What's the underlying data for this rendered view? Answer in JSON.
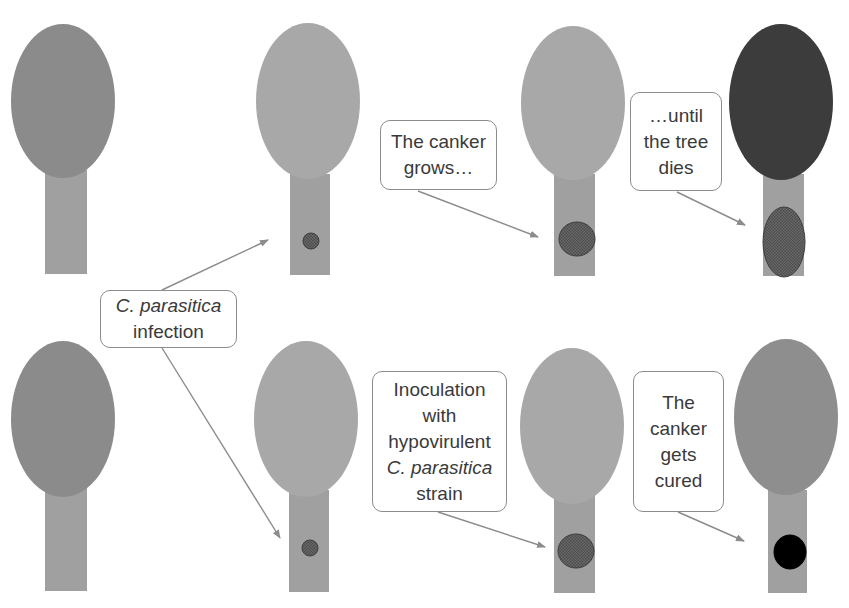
{
  "diagram": {
    "colors": {
      "crown_healthy_dark": "#8b8b8b",
      "crown_healthy_light": "#a6a6a6",
      "crown_dead": "#3c3c3c",
      "trunk": "#a0a0a0",
      "trunk_dark": "#939393",
      "canker": "#5e5e5e",
      "canker_cured": "#000000",
      "arrow": "#8c8c8c",
      "callout_border": "#8c8c8c",
      "text": "#3a3a3a"
    },
    "rows": [
      {
        "name": "untreated",
        "trees": [
          {
            "id": "top-1",
            "state": "healthy",
            "crown": {
              "cx": 63,
              "cy": 101,
              "rx": 52,
              "ry": 77,
              "color": "#8b8b8b"
            },
            "trunk": {
              "x": 45,
              "y": 170,
              "w": 42,
              "h": 104
            },
            "canker": null
          },
          {
            "id": "top-2",
            "state": "infected",
            "crown": {
              "cx": 308,
              "cy": 101,
              "rx": 52,
              "ry": 78,
              "color": "#a8a8a8"
            },
            "trunk": {
              "x": 290,
              "y": 174,
              "w": 40,
              "h": 101
            },
            "canker": {
              "shape": "circle",
              "cx": 311,
              "cy": 241,
              "rx": 8,
              "ry": 8,
              "color": "#5e5e5e"
            }
          },
          {
            "id": "top-3",
            "state": "canker-growing",
            "crown": {
              "cx": 573,
              "cy": 103,
              "rx": 52,
              "ry": 77,
              "color": "#a8a8a8"
            },
            "trunk": {
              "x": 554,
              "y": 174,
              "w": 41,
              "h": 102
            },
            "canker": {
              "shape": "circle",
              "cx": 577,
              "cy": 239,
              "rx": 18,
              "ry": 17,
              "color": "#5e5e5e"
            }
          },
          {
            "id": "top-4",
            "state": "dead",
            "crown": {
              "cx": 781,
              "cy": 102,
              "rx": 52,
              "ry": 78,
              "color": "#3c3c3c"
            },
            "trunk": {
              "x": 763,
              "y": 174,
              "w": 41,
              "h": 102
            },
            "canker": {
              "shape": "ellipse",
              "cx": 784,
              "cy": 242,
              "rx": 21,
              "ry": 35,
              "color": "#5e5e5e"
            }
          }
        ]
      },
      {
        "name": "treated",
        "trees": [
          {
            "id": "bottom-1",
            "state": "healthy",
            "crown": {
              "cx": 63,
              "cy": 419,
              "rx": 52,
              "ry": 78,
              "color": "#8b8b8b"
            },
            "trunk": {
              "x": 45,
              "y": 488,
              "w": 42,
              "h": 103
            },
            "canker": null
          },
          {
            "id": "bottom-2",
            "state": "infected",
            "crown": {
              "cx": 306,
              "cy": 419,
              "rx": 52,
              "ry": 78,
              "color": "#a8a8a8"
            },
            "trunk": {
              "x": 289,
              "y": 490,
              "w": 40,
              "h": 102
            },
            "canker": {
              "shape": "circle",
              "cx": 310,
              "cy": 548,
              "rx": 8,
              "ry": 8,
              "color": "#5e5e5e"
            }
          },
          {
            "id": "bottom-3",
            "state": "inoculated",
            "crown": {
              "cx": 572,
              "cy": 426,
              "rx": 52,
              "ry": 78,
              "color": "#a8a8a8"
            },
            "trunk": {
              "x": 554,
              "y": 494,
              "w": 41,
              "h": 99
            },
            "canker": {
              "shape": "circle",
              "cx": 576,
              "cy": 551,
              "rx": 18,
              "ry": 17,
              "color": "#5e5e5e"
            }
          },
          {
            "id": "bottom-4",
            "state": "cured",
            "crown": {
              "cx": 786,
              "cy": 417,
              "rx": 52,
              "ry": 78,
              "color": "#8e8e8e"
            },
            "trunk": {
              "x": 768,
              "y": 490,
              "w": 39,
              "h": 103
            },
            "canker": {
              "shape": "circle",
              "cx": 790,
              "cy": 552,
              "rx": 16,
              "ry": 17,
              "color": "#000000"
            }
          }
        ]
      }
    ],
    "callouts": [
      {
        "id": "infection",
        "x": 100,
        "y": 290,
        "w": 137,
        "h": 58,
        "lines": [
          {
            "text": "C. parasitica",
            "italic": true
          },
          {
            "text": "infection",
            "italic": false
          }
        ]
      },
      {
        "id": "canker-grows",
        "x": 380,
        "y": 120,
        "w": 117,
        "h": 70,
        "lines": [
          {
            "text": "The canker",
            "italic": false
          },
          {
            "text": "grows…",
            "italic": false
          }
        ]
      },
      {
        "id": "tree-dies",
        "x": 630,
        "y": 92,
        "w": 92,
        "h": 99,
        "lines": [
          {
            "text": "…until",
            "italic": false
          },
          {
            "text": "the tree",
            "italic": false
          },
          {
            "text": "dies",
            "italic": false
          }
        ]
      },
      {
        "id": "inoculation",
        "x": 372,
        "y": 371,
        "w": 135,
        "h": 141,
        "lines": [
          {
            "text": "Inoculation",
            "italic": false
          },
          {
            "text": "with",
            "italic": false
          },
          {
            "text": "hypovirulent",
            "italic": false
          },
          {
            "text": "C. parasitica",
            "italic": true
          },
          {
            "text": "strain",
            "italic": false
          }
        ]
      },
      {
        "id": "cured",
        "x": 633,
        "y": 371,
        "w": 91,
        "h": 141,
        "lines": [
          {
            "text": "The",
            "italic": false
          },
          {
            "text": "canker",
            "italic": false
          },
          {
            "text": "gets",
            "italic": false
          },
          {
            "text": "cured",
            "italic": false
          }
        ]
      }
    ],
    "arrows": [
      {
        "id": "infection-to-top",
        "x1": 162,
        "y1": 290,
        "x2": 268,
        "y2": 240
      },
      {
        "id": "infection-to-bottom",
        "x1": 162,
        "y1": 348,
        "x2": 280,
        "y2": 538
      },
      {
        "id": "grows-to-canker",
        "x1": 418,
        "y1": 191,
        "x2": 538,
        "y2": 237
      },
      {
        "id": "dies-to-canker",
        "x1": 677,
        "y1": 192,
        "x2": 745,
        "y2": 225
      },
      {
        "id": "inoculation-to-canker",
        "x1": 438,
        "y1": 512,
        "x2": 545,
        "y2": 547
      },
      {
        "id": "cured-to-canker",
        "x1": 678,
        "y1": 512,
        "x2": 744,
        "y2": 541
      }
    ]
  }
}
